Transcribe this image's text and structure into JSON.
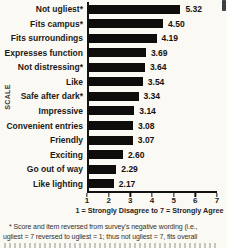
{
  "chart_data": {
    "type": "bar",
    "orientation": "horizontal",
    "title": "",
    "ylabel": "SCALE",
    "xlabel": "1 = Strongly Disagree to 7 = Strongly Agree",
    "xlim": [
      1,
      7
    ],
    "xticks": [
      1,
      2,
      3,
      4,
      5,
      6,
      7
    ],
    "bar_color": "#0f0d0b",
    "categories": [
      "Not ugliest*",
      "Fits campus*",
      "Fits surroundings",
      "Expresses function",
      "Not distressing*",
      "Like",
      "Safe after dark*",
      "Impressive",
      "Convenient entries",
      "Friendly",
      "Exciting",
      "Go out of way",
      "Like lighting"
    ],
    "values": [
      5.32,
      4.5,
      4.19,
      3.69,
      3.64,
      3.54,
      3.34,
      3.14,
      3.08,
      3.07,
      2.6,
      2.29,
      2.17
    ],
    "value_labels": [
      "5.32",
      "4.50",
      "4.19",
      "3.69",
      "3.64",
      "3.54",
      "3.34",
      "3.14",
      "3.08",
      "3.07",
      "2.60",
      "2.29",
      "2.17"
    ]
  },
  "footnote": {
    "line1": "* Score and item reversed from survey's negative wording (i.e.,",
    "line2": "ugliest = 7 reversed to ugliest = 1; thus not ugliest = 7, fits overall"
  }
}
